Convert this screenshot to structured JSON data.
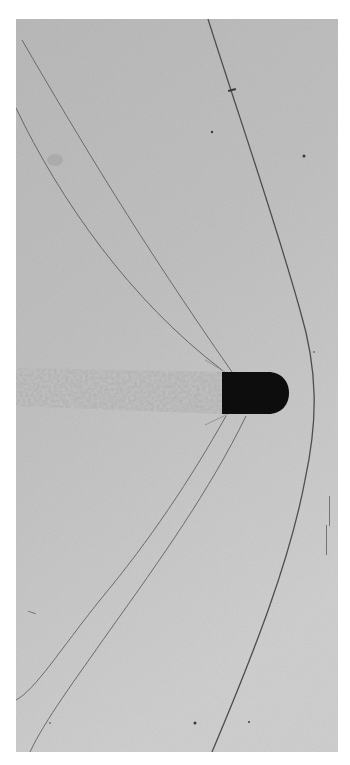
{
  "image": {
    "subject": "Shadowgraph of a supersonic bullet in flight",
    "palette": {
      "page_background": "#ffffff",
      "photo_background": "#b9b9b9",
      "photo_background_light": "#c8c8c8",
      "bullet": "#0c0c0c",
      "shock_line": "#5a5a5a",
      "wake": "#a8a8a8"
    },
    "frame": {
      "x": 16,
      "y": 19,
      "width": 322,
      "height": 733
    },
    "bullet": {
      "base_x": 222,
      "nose_x": 288,
      "top_y": 372,
      "bottom_y": 414
    },
    "features": [
      "bow-shock",
      "upper-tail-shocks",
      "lower-tail-shocks",
      "turbulent-wake",
      "dust-specks"
    ]
  }
}
